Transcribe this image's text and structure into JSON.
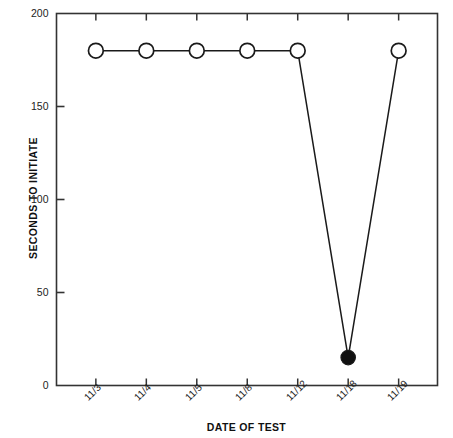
{
  "chart_data": {
    "type": "line",
    "title": "",
    "xlabel": "DATE OF TEST",
    "ylabel": "SECONDS TO INITIATE",
    "categories": [
      "11/3",
      "11/4",
      "11/5",
      "11/8",
      "11/12",
      "11/18",
      "11/19"
    ],
    "values": [
      180,
      180,
      180,
      180,
      180,
      15,
      180
    ],
    "series": [
      {
        "name": "Seconds to initiate",
        "values": [
          180,
          180,
          180,
          180,
          180,
          15,
          180
        ],
        "marker_fill": [
          "open",
          "open",
          "open",
          "open",
          "open",
          "filled",
          "open"
        ]
      }
    ],
    "ylim": [
      0,
      200
    ],
    "yticks": [
      0,
      50,
      100,
      150,
      200
    ],
    "ytick_labels": [
      "0",
      "50",
      "100",
      "150",
      "200"
    ],
    "grid": false,
    "legend": "none",
    "line_color": "#1a1a1a",
    "marker_open_fill": "#ffffff",
    "marker_filled_fill": "#111111",
    "background": "#ffffff",
    "axis_color": "#333333"
  },
  "axes": {
    "y_title": "SECONDS TO INITIATE",
    "x_title": "DATE OF TEST"
  }
}
